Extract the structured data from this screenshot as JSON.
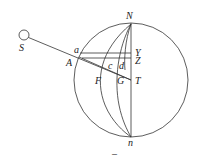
{
  "diagram": {
    "colors": {
      "stroke": "#333333",
      "text": "#222222",
      "background": "#ffffff"
    },
    "labels": {
      "S": "S",
      "a": "a",
      "A": "A",
      "N": "N",
      "n": "n",
      "Y": "Y",
      "Z": "Z",
      "c": "c",
      "d": "d",
      "F": "F",
      "G": "G",
      "T": "T",
      "caption": "–"
    }
  }
}
